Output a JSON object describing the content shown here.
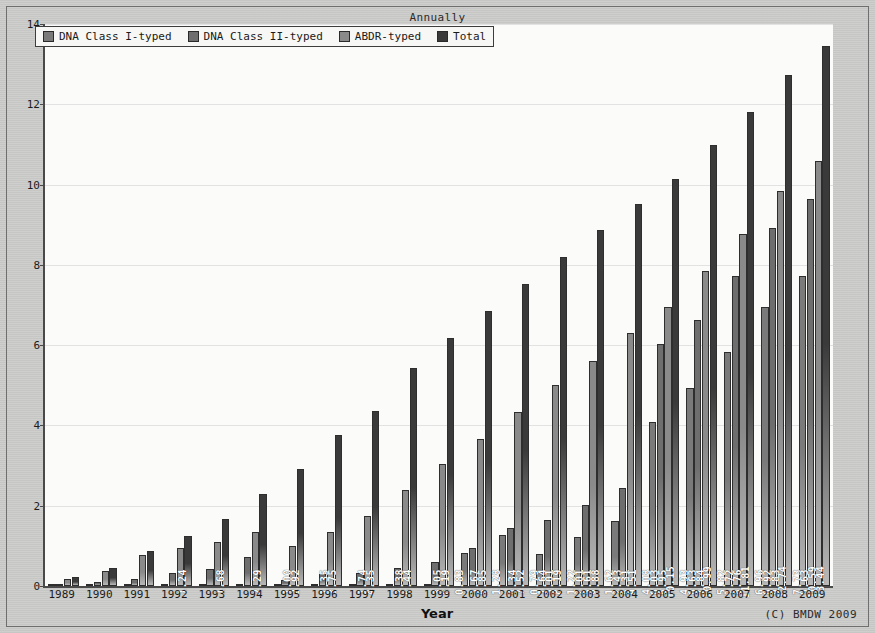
{
  "chart_data": {
    "type": "bar",
    "title": "Annually",
    "xlabel": "Year",
    "ylabel": "Number (x million)",
    "credit": "(C) BMDW 2009",
    "ylim": [
      0,
      14
    ],
    "yticks": [
      0,
      2,
      4,
      6,
      8,
      10,
      12,
      14
    ],
    "grid": true,
    "legend_position": "top-left",
    "categories": [
      "1989",
      "1990",
      "1991",
      "1992",
      "1993",
      "1994",
      "1995",
      "1996",
      "1997",
      "1998",
      "1999",
      "2000",
      "2001",
      "2002",
      "2003",
      "2004",
      "2005",
      "2006",
      "2007",
      "2008",
      "2009"
    ],
    "series": [
      {
        "name": "DNA Class I-typed",
        "color": "#7a7a7a",
        "values": [
          0.0,
          0.0,
          0.0,
          0.0,
          0.0,
          0.0,
          0.0,
          0.0,
          0.0,
          0.0,
          0.0,
          0.83,
          1.28,
          0.79,
          1.22,
          1.62,
          4.08,
          4.93,
          5.82,
          6.96,
          7.73
        ],
        "labels": [
          "",
          "",
          "",
          "",
          "",
          "",
          "",
          "",
          "",
          "",
          "",
          "0.83",
          "1.28",
          "0.79",
          "1.22",
          "1.62",
          "4.08",
          "4.93",
          "5.82",
          "6.96",
          "7.73"
        ]
      },
      {
        "name": "DNA Class II-typed",
        "color": "#6e6e6e",
        "values": [
          0.05,
          0.1,
          0.18,
          0.32,
          0.42,
          0.72,
          0.14,
          0.3,
          0.32,
          0.46,
          0.6,
          0.95,
          1.45,
          1.64,
          2.01,
          2.43,
          6.03,
          6.63,
          7.72,
          8.92,
          9.63
        ],
        "labels": [
          "",
          "",
          "",
          "",
          "",
          "",
          "",
          "",
          "",
          "",
          "",
          "",
          "",
          "1.64",
          "2.01",
          "2.43",
          "6.03",
          "6.63",
          "7.72",
          "8.92",
          "9.63"
        ]
      },
      {
        "name": "ABDR-typed",
        "color": "#8a8a8a",
        "values": [
          0.18,
          0.38,
          0.78,
          0.95,
          1.1,
          1.35,
          1.0,
          1.35,
          1.74,
          2.38,
          3.05,
          3.67,
          4.34,
          5.01,
          5.61,
          6.31,
          6.95,
          7.84,
          8.76,
          9.83,
          10.59
        ],
        "labels": [
          "",
          "",
          "",
          "",
          "",
          "",
          "1.00",
          "1.35",
          "1.74",
          "2.38",
          "3.05",
          "3.67",
          "4.34",
          "5.01",
          "5.61",
          "6.31",
          "6.95",
          "7.84",
          "8.76",
          "9.83",
          "10.59"
        ]
      },
      {
        "name": "Total",
        "color": "#3a3a3a",
        "values": [
          0.22,
          0.45,
          0.86,
          1.24,
          1.68,
          2.29,
          2.92,
          3.75,
          4.35,
          5.44,
          6.19,
          6.85,
          7.52,
          8.19,
          8.88,
          9.51,
          10.15,
          10.99,
          11.81,
          12.74,
          13.44
        ],
        "labels": [
          "",
          "",
          "",
          "1.24",
          "1.68",
          "2.29",
          "2.92",
          "3.75",
          "4.35",
          "5.44",
          "6.19",
          "6.85",
          "7.52",
          "8.19",
          "8.88",
          "9.51",
          "10.15",
          "10.99",
          "11.81",
          "12.74",
          "13.44"
        ]
      }
    ]
  }
}
